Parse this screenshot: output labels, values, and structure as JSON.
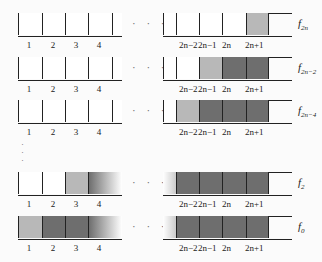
{
  "rows": [
    {
      "label": "f",
      "sub": "2n",
      "left": [
        "white",
        "white",
        "white",
        "white",
        "white"
      ],
      "right": [
        "white",
        "white",
        "white",
        "white",
        "light"
      ],
      "y": 13,
      "ly": 40
    },
    {
      "label": "f",
      "sub": "2n−2",
      "left": [
        "white",
        "white",
        "white",
        "white",
        "white"
      ],
      "right": [
        "white",
        "white",
        "light",
        "dark",
        "dark"
      ],
      "y": 57,
      "ly": 84
    },
    {
      "label": "f",
      "sub": "2n−4",
      "left": [
        "white",
        "white",
        "white",
        "white",
        "white"
      ],
      "right": [
        "white",
        "light",
        "dark",
        "dark",
        "dark"
      ],
      "y": 100,
      "ly": 127
    },
    {
      "label": "f",
      "sub": "2",
      "left": [
        "white",
        "white",
        "light",
        "fadeL"
      ],
      "right": [
        "fadeR",
        "dark",
        "dark",
        "dark",
        "dark"
      ],
      "y": 172,
      "ly": 199
    },
    {
      "label": "f",
      "sub": "0",
      "left": [
        "light",
        "dark",
        "dark",
        "fadeL"
      ],
      "right": [
        "fadeR",
        "dark",
        "dark",
        "dark",
        "dark"
      ],
      "y": 216,
      "ly": 243
    }
  ],
  "left_indices": [
    "1",
    "2",
    "3",
    "4"
  ],
  "right_indices": [
    "2n−2",
    "2n−1",
    "2n",
    "2n+1"
  ],
  "ellipsis": "· · ·",
  "vertical_ellipsis": "·",
  "colors": {
    "white": "#ffffff",
    "light": "#b8b8b8",
    "dark": "#6e6e6e",
    "line": "#222222"
  }
}
